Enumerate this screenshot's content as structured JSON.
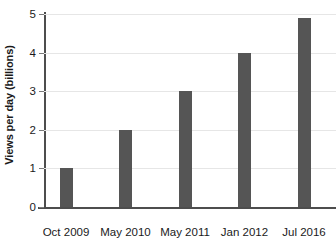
{
  "chart_data": {
    "type": "bar",
    "title": "",
    "subtitle": "",
    "xlabel": "",
    "ylabel": "Views per day (billions)",
    "categories": [
      "Oct 2009",
      "May 2010",
      "May 2011",
      "Jan 2012",
      "Jul 2016"
    ],
    "values": [
      1.0,
      2.0,
      3.0,
      4.0,
      4.9
    ],
    "ylim": [
      0,
      5
    ],
    "yticks": [
      0,
      1,
      2,
      3,
      4,
      5
    ],
    "ytick_labels": [
      "0",
      "1",
      "2",
      "3",
      "4",
      "5"
    ],
    "grid": "horizontal",
    "legend": "none",
    "bar_color": "#555555",
    "axis_color": "#4d4d4d",
    "gridline_color": "#e6e6e6",
    "background_color": "#ffffff",
    "text_color": "#1a1a1a"
  }
}
